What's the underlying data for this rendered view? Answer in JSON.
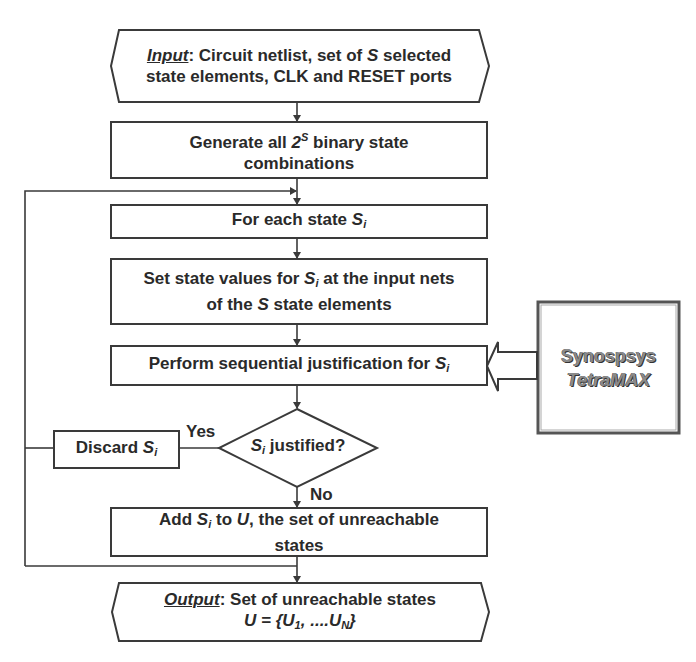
{
  "diagram": {
    "type": "flowchart",
    "colors": {
      "stroke": "#3a3a3a",
      "fill": "#ffffff",
      "text": "#2a2a2a",
      "tool_text": "#8a8a8a"
    },
    "nodes": {
      "input": {
        "shape": "hexagon",
        "label_prefix": "Input",
        "line1_a": ": Circuit netlist, set of ",
        "line1_var": "S",
        "line1_b": " selected",
        "line2": "state elements, CLK and RESET ports"
      },
      "generate": {
        "shape": "rectangle",
        "line1_a": "Generate all ",
        "base": "2",
        "exponent": "S",
        "line1_b": " binary state",
        "line2": "combinations"
      },
      "for_each": {
        "shape": "rectangle",
        "text": "For each state ",
        "var": "S",
        "var_sub": "i"
      },
      "set_state": {
        "shape": "rectangle",
        "line1_a": "Set state values for ",
        "var": "S",
        "var_sub": "i",
        "line1_b": " at the input nets",
        "line2_a": "of the ",
        "line2_var": "S",
        "line2_b": " state elements"
      },
      "perform": {
        "shape": "rectangle",
        "text": "Perform sequential justification for ",
        "var": "S",
        "var_sub": "i"
      },
      "decision": {
        "shape": "diamond",
        "var": "S",
        "var_sub": "i",
        "text": " justified?"
      },
      "discard": {
        "shape": "rectangle",
        "text": "Discard ",
        "var": "S",
        "var_sub": "i"
      },
      "add": {
        "shape": "rectangle",
        "text_a": "Add ",
        "var": "S",
        "var_sub": "i",
        "text_b": " to ",
        "var2": "U",
        "text_c": ", the set of unreachable",
        "line2": "states"
      },
      "output": {
        "shape": "hexagon",
        "label_prefix": "Output",
        "line1": ": Set of unreachable states",
        "line2_a": "U = {U",
        "sub1": "1",
        "line2_b": ", ....U",
        "subN": "N",
        "line2_c": "}"
      },
      "tool": {
        "shape": "rectangle-double",
        "line1": "Synospsys",
        "line2": "TetraMAX"
      }
    },
    "edge_labels": {
      "yes": "Yes",
      "no": "No"
    },
    "edges": [
      {
        "from": "input",
        "to": "generate"
      },
      {
        "from": "generate",
        "to": "for_each"
      },
      {
        "from": "for_each",
        "to": "set_state"
      },
      {
        "from": "set_state",
        "to": "perform"
      },
      {
        "from": "perform",
        "to": "decision"
      },
      {
        "from": "decision",
        "to": "discard",
        "label": "Yes"
      },
      {
        "from": "decision",
        "to": "add",
        "label": "No"
      },
      {
        "from": "discard",
        "to": "for_each",
        "type": "loop"
      },
      {
        "from": "add",
        "to": "for_each",
        "type": "loop"
      },
      {
        "from": "add",
        "to": "output"
      },
      {
        "from": "tool",
        "to": "perform",
        "type": "block-arrow"
      }
    ]
  }
}
